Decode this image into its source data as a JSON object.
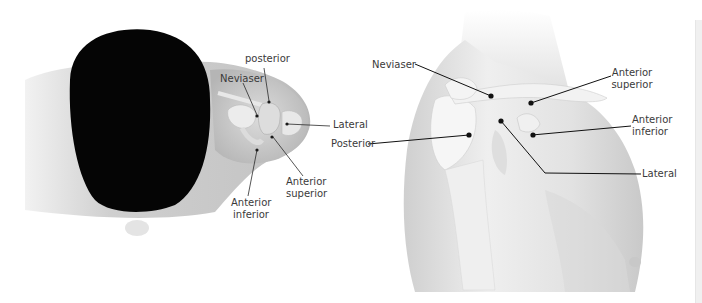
{
  "figure": {
    "left_panel": {
      "view": "superior view",
      "labels": {
        "posterior": "posterior",
        "neviaser": "Neviaser",
        "lateral": "Lateral",
        "anterior_superior_line1": "Anterior",
        "anterior_superior_line2": "superior",
        "anterior_inferior_line1": "Anterior",
        "anterior_inferior_line2": "inferior"
      }
    },
    "right_panel": {
      "view": "anterolateral view",
      "labels": {
        "neviaser": "Neviaser",
        "anterior_superior_line1": "Anterior",
        "anterior_superior_line2": "superior",
        "anterior_inferior_line1": "Anterior",
        "anterior_inferior_line2": "inferior",
        "posterior": "Posterior",
        "lateral": "Lateral"
      }
    },
    "colors": {
      "hair": "#050505",
      "skin": "#d6d6d6",
      "skin_light": "#ececec",
      "bone": "#f4f4f4",
      "leader_line": "#1a1a1a",
      "label_text": "#3a3a3a"
    }
  }
}
